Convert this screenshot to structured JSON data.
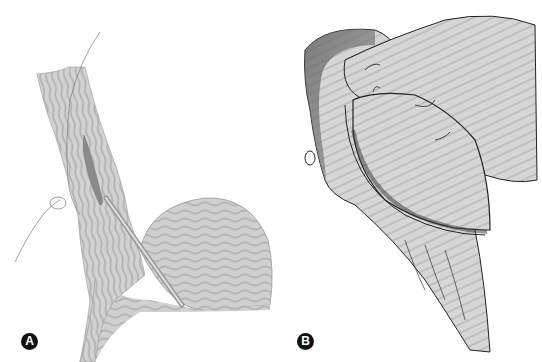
{
  "figure": {
    "panels": [
      {
        "id": "A",
        "label": "A",
        "description": "Tubular structure with suture loop and catheter/probe inserted into rounded organ"
      },
      {
        "id": "B",
        "label": "B",
        "description": "Retracted tissue flap exposing oval structure with sutures and vessels"
      }
    ],
    "colors": {
      "fill": "#c8c8c8",
      "stripe": "#b4b4b4",
      "line": "#555555",
      "dark": "#222222",
      "label_bg": "#111111"
    }
  }
}
